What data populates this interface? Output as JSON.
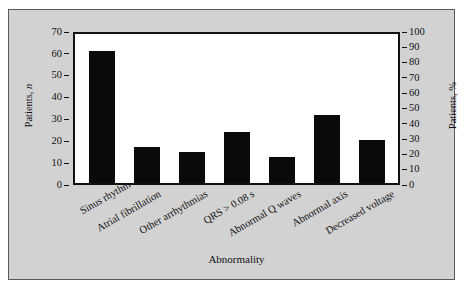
{
  "chart_data": {
    "type": "bar",
    "title": "",
    "xlabel": "Abnormality",
    "ylabel": "Patients, n",
    "ylabel_right": "Patients, %",
    "ylabel_main_prefix": "Patients, ",
    "ylabel_main_variable": "n",
    "categories": [
      "Sinus rhythm",
      "Atrial fibrillation",
      "Other arrhythmias",
      "QRS > 0.08 s",
      "Abnormal Q waves",
      "Abnormal axis",
      "Decreased voltage"
    ],
    "values": [
      62,
      17,
      14.5,
      24,
      12,
      32,
      20
    ],
    "ylim": [
      0,
      70
    ],
    "yticks": [
      0,
      10,
      20,
      30,
      40,
      50,
      60,
      70
    ],
    "ylim_right": [
      0,
      100
    ],
    "yticks_right": [
      0,
      10,
      20,
      30,
      40,
      50,
      60,
      70,
      80,
      90,
      100
    ],
    "grid": false,
    "legend": "none",
    "bar_color": "#0a0a0a",
    "panel_color": "#d2d2d2",
    "plot_background": "#ffffff"
  }
}
